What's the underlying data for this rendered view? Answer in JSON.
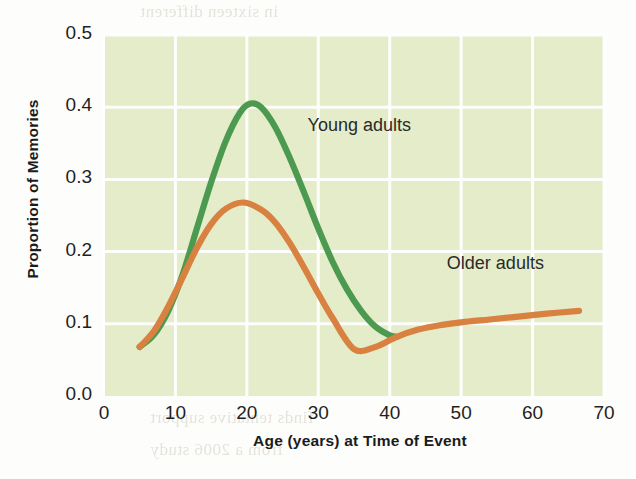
{
  "chart_data": {
    "type": "line",
    "title": "",
    "xlabel": "Age (years) at Time of Event",
    "ylabel": "Proportion of Memories",
    "xlim": [
      0,
      70
    ],
    "ylim": [
      0.0,
      0.5
    ],
    "xticks": [
      "0",
      "10",
      "20",
      "30",
      "40",
      "50",
      "60",
      "70"
    ],
    "xtick_values": [
      0,
      10,
      20,
      30,
      40,
      50,
      60,
      70
    ],
    "yticks": [
      "0.0",
      "0.1",
      "0.2",
      "0.3",
      "0.4",
      "0.5"
    ],
    "ytick_values": [
      0.0,
      0.1,
      0.2,
      0.3,
      0.4,
      0.5
    ],
    "grid": true,
    "grid_color": "#ffffff",
    "plot_background": "#e4ecc9",
    "legend": "inline-annotations",
    "series": [
      {
        "name": "Young adults",
        "color": "#4c9a4f",
        "label_x": 28.5,
        "label_y": 0.372,
        "x": [
          5,
          7,
          9,
          11,
          13,
          15,
          17,
          19,
          20.5,
          22,
          24,
          26,
          28,
          30,
          32,
          34,
          36,
          38,
          40,
          41
        ],
        "y": [
          0.068,
          0.085,
          0.118,
          0.168,
          0.232,
          0.296,
          0.352,
          0.392,
          0.405,
          0.4,
          0.372,
          0.33,
          0.282,
          0.232,
          0.186,
          0.148,
          0.118,
          0.096,
          0.084,
          0.082
        ]
      },
      {
        "name": "Older adults",
        "color": "#d9813f",
        "label_x": 48.0,
        "label_y": 0.182,
        "x": [
          5,
          7,
          9,
          11,
          13,
          15,
          17,
          19.5,
          22,
          24,
          26,
          28,
          30,
          32,
          35,
          38,
          41,
          44,
          47,
          50,
          54,
          58,
          62,
          66.5
        ],
        "y": [
          0.068,
          0.09,
          0.124,
          0.164,
          0.205,
          0.238,
          0.259,
          0.268,
          0.258,
          0.24,
          0.212,
          0.178,
          0.142,
          0.108,
          0.065,
          0.068,
          0.082,
          0.092,
          0.098,
          0.102,
          0.106,
          0.11,
          0.114,
          0.118
        ]
      }
    ]
  },
  "background_bleed": {
    "lines": [
      "in sixteen different",
      "ionnaire administered",
      "). A huge cross-section",
      "ma suggests that",
      "creases in adolescence",
      "Castaneda, 2006). There",
      "difference is that the",
      "on emotional memory",
      "about common events",
      "that the information",
      "finds tentative support",
      "from a 2006 study"
    ]
  }
}
